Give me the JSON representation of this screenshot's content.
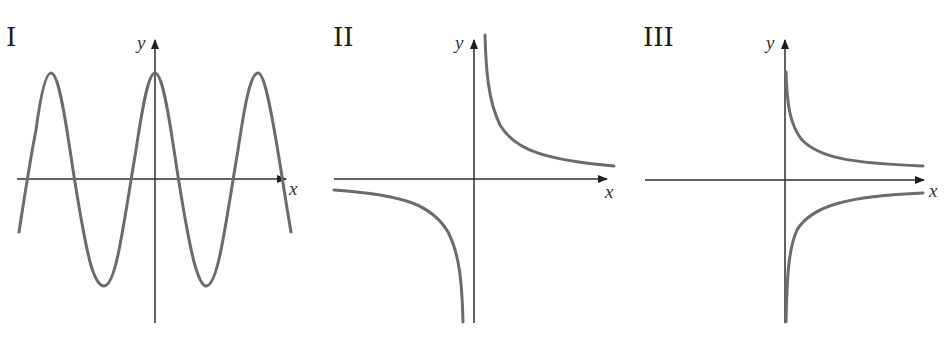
{
  "panels": [
    {
      "id": "I",
      "label": "I",
      "x_label": "x",
      "y_label": "y",
      "description": "periodic cosine-like wave crossing the x-axis, maximum at x=0"
    },
    {
      "id": "II",
      "label": "II",
      "x_label": "x",
      "y_label": "y",
      "description": "hyperbola in quadrants I and III, asymptotes at both axes"
    },
    {
      "id": "III",
      "label": "III",
      "x_label": "x",
      "y_label": "y",
      "description": "two branches for x>0 only, one above and one below the x-axis, mirrored about the x-axis"
    }
  ],
  "colors": {
    "curve": "#6b6b6b",
    "axis": "#2e2e2e",
    "text": "#1a1a1a",
    "background": "#ffffff"
  }
}
